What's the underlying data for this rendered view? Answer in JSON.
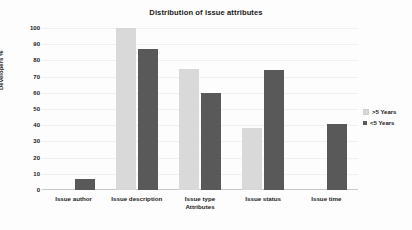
{
  "chart_data": {
    "type": "bar",
    "title": "Distribution of issue attributes",
    "xlabel": "Attributes",
    "ylabel": "Developers %",
    "ylim": [
      0,
      100
    ],
    "ytick_step": 10,
    "yticks": [
      100,
      90,
      80,
      70,
      60,
      50,
      40,
      30,
      20,
      10,
      0
    ],
    "grid": true,
    "legend_position": "right",
    "categories": [
      "Issue author",
      "Issue description",
      "Issue type",
      "Issue status",
      "Issue time"
    ],
    "series": [
      {
        "name": ">5 Years",
        "color": "#d9d9d9",
        "values": [
          null,
          100,
          75,
          38,
          null
        ]
      },
      {
        "name": "<5 Years",
        "color": "#595959",
        "values": [
          7,
          87,
          60,
          74,
          41
        ]
      }
    ]
  },
  "colors": {
    "series_a": "#d9d9d9",
    "series_b": "#595959",
    "gridline": "#f0f0f0",
    "axis": "#c8c8c8",
    "text": "#1a1a1a",
    "background": "#fdfdfd"
  }
}
